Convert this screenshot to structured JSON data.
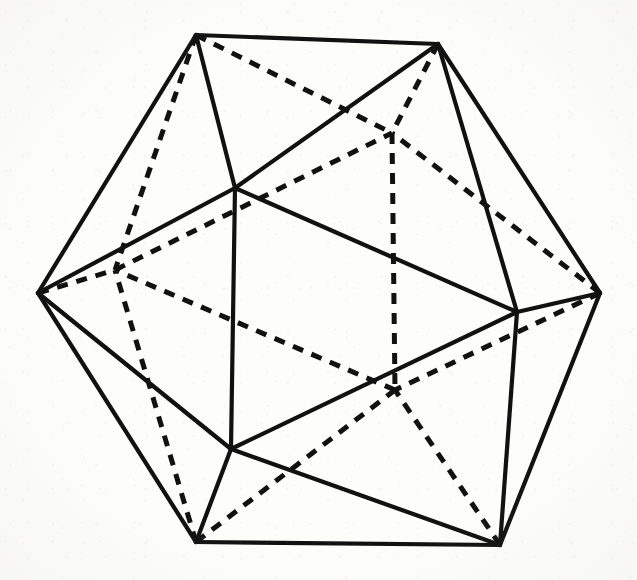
{
  "figure": {
    "background_color": "#fdfdfc",
    "stroke_color": "#111111",
    "width": 637,
    "height": 580
  },
  "chart_data": {
    "type": "diagram",
    "subtype": "polyhedron-wireframe",
    "xlabel": "",
    "ylabel": "",
    "grid": false,
    "legend": null,
    "annotations": [],
    "solid_color": "#111111",
    "dashed_color": "#111111",
    "solid_width": 4.2,
    "dashed_width": 5.0,
    "dash_pattern": "11 9",
    "vertex_count": 12,
    "edge_count": 30,
    "vertices": [
      {
        "id": "L",
        "label": "left",
        "x": 38,
        "y": 293,
        "visible": true
      },
      {
        "id": "TL",
        "label": "top-left",
        "x": 196,
        "y": 35,
        "visible": true
      },
      {
        "id": "TR",
        "label": "top-right",
        "x": 438,
        "y": 44,
        "visible": true
      },
      {
        "id": "R",
        "label": "right",
        "x": 600,
        "y": 293,
        "visible": true
      },
      {
        "id": "BR",
        "label": "bottom-right",
        "x": 500,
        "y": 545,
        "visible": true
      },
      {
        "id": "BL",
        "label": "bottom-left",
        "x": 196,
        "y": 542,
        "visible": true
      },
      {
        "id": "FT",
        "label": "front-top",
        "x": 235,
        "y": 188,
        "visible": true
      },
      {
        "id": "FR",
        "label": "front-right",
        "x": 517,
        "y": 312,
        "visible": true
      },
      {
        "id": "FB",
        "label": "front-bottom",
        "x": 231,
        "y": 449,
        "visible": true
      },
      {
        "id": "BK1",
        "label": "back-left",
        "x": 115,
        "y": 270,
        "visible": false
      },
      {
        "id": "BK2",
        "label": "back-top",
        "x": 392,
        "y": 133,
        "visible": false
      },
      {
        "id": "BK3",
        "label": "back-bottom",
        "x": 395,
        "y": 390,
        "visible": false
      }
    ],
    "edges_solid": [
      {
        "from": "L",
        "to": "TL"
      },
      {
        "from": "TL",
        "to": "TR"
      },
      {
        "from": "TR",
        "to": "R"
      },
      {
        "from": "R",
        "to": "BR"
      },
      {
        "from": "BR",
        "to": "BL"
      },
      {
        "from": "BL",
        "to": "L"
      },
      {
        "from": "FT",
        "to": "FR"
      },
      {
        "from": "FR",
        "to": "FB"
      },
      {
        "from": "FB",
        "to": "FT"
      },
      {
        "from": "L",
        "to": "FT"
      },
      {
        "from": "TL",
        "to": "FT"
      },
      {
        "from": "TR",
        "to": "FT"
      },
      {
        "from": "TR",
        "to": "FR"
      },
      {
        "from": "R",
        "to": "FR"
      },
      {
        "from": "BR",
        "to": "FR"
      },
      {
        "from": "BR",
        "to": "FB"
      },
      {
        "from": "BL",
        "to": "FB"
      },
      {
        "from": "L",
        "to": "FB"
      }
    ],
    "edges_dashed": [
      {
        "from": "BK1",
        "to": "BK2"
      },
      {
        "from": "BK2",
        "to": "BK3"
      },
      {
        "from": "BK3",
        "to": "BK1"
      },
      {
        "from": "L",
        "to": "BK1"
      },
      {
        "from": "TL",
        "to": "BK1"
      },
      {
        "from": "BL",
        "to": "BK1"
      },
      {
        "from": "TL",
        "to": "BK2"
      },
      {
        "from": "TR",
        "to": "BK2"
      },
      {
        "from": "R",
        "to": "BK2"
      },
      {
        "from": "R",
        "to": "BK3"
      },
      {
        "from": "BR",
        "to": "BK3"
      },
      {
        "from": "BL",
        "to": "BK3"
      }
    ]
  }
}
